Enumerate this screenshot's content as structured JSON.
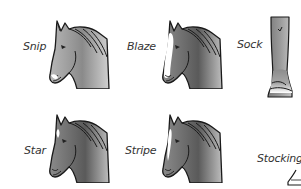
{
  "figure": {
    "markings": [
      {
        "id": "snip",
        "label": "Snip",
        "kind": "face",
        "icon": "horse-head-snip-icon"
      },
      {
        "id": "blaze",
        "label": "Blaze",
        "kind": "face",
        "icon": "horse-head-blaze-icon"
      },
      {
        "id": "sock",
        "label": "Sock",
        "kind": "leg",
        "icon": "horse-leg-sock-icon"
      },
      {
        "id": "star",
        "label": "Star",
        "kind": "face",
        "icon": "horse-head-star-icon"
      },
      {
        "id": "stripe",
        "label": "Stripe",
        "kind": "face",
        "icon": "horse-head-stripe-icon"
      },
      {
        "id": "stocking",
        "label": "Stocking",
        "kind": "leg",
        "icon": "horse-leg-stocking-icon"
      }
    ],
    "colors": {
      "coat_light": "#c8c8c8",
      "coat_dark": "#6e6e6e",
      "outline": "#1a1a1a",
      "white_marking": "#ffffff",
      "label_text": "#333333"
    }
  }
}
